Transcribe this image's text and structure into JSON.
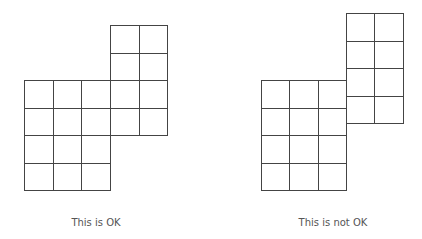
{
  "figures": [
    {
      "id": "ok",
      "caption": "This is OK",
      "blocks": [
        {
          "name": "lower-block",
          "cols": 3,
          "rows": 4
        },
        {
          "name": "upper-block",
          "cols": 2,
          "rows": 4,
          "aligned_to_grid": true
        }
      ]
    },
    {
      "id": "not-ok",
      "caption": "This is not OK",
      "blocks": [
        {
          "name": "lower-block",
          "cols": 3,
          "rows": 4
        },
        {
          "name": "upper-block",
          "cols": 2,
          "rows": 4,
          "aligned_to_grid": false
        }
      ]
    }
  ],
  "colors": {
    "line": "#444444",
    "caption": "#555555"
  }
}
